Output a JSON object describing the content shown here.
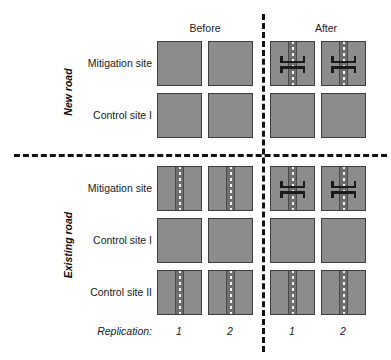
{
  "figure": {
    "type": "experimental-design-diagram",
    "colors": {
      "cell_fill": "#8c8c8c",
      "cell_border": "#3d3d3d",
      "road_fill": "#6e6e6e",
      "road_centerline": "#f2f2f2",
      "crossing_structure": "#1a1a1a",
      "divider": "#121212",
      "background": "#ffffff",
      "text": "#1a1a1a"
    },
    "column_headers": [
      {
        "label": "Before"
      },
      {
        "label": "After"
      }
    ],
    "sections": [
      {
        "name": "New road",
        "rows": [
          {
            "label": "Mitigation site",
            "cells": [
              {
                "period": "Before",
                "replication": "1",
                "road": false,
                "crossings": 0
              },
              {
                "period": "Before",
                "replication": "2",
                "road": false,
                "crossings": 0
              },
              {
                "period": "After",
                "replication": "1",
                "road": true,
                "crossings": 2
              },
              {
                "period": "After",
                "replication": "2",
                "road": true,
                "crossings": 2
              }
            ]
          },
          {
            "label": "Control site I",
            "cells": [
              {
                "period": "Before",
                "replication": "1",
                "road": false,
                "crossings": 0
              },
              {
                "period": "Before",
                "replication": "2",
                "road": false,
                "crossings": 0
              },
              {
                "period": "After",
                "replication": "1",
                "road": false,
                "crossings": 0
              },
              {
                "period": "After",
                "replication": "2",
                "road": false,
                "crossings": 0
              }
            ]
          }
        ]
      },
      {
        "name": "Existing road",
        "rows": [
          {
            "label": "Mitigation site",
            "cells": [
              {
                "period": "Before",
                "replication": "1",
                "road": true,
                "crossings": 0
              },
              {
                "period": "Before",
                "replication": "2",
                "road": true,
                "crossings": 0
              },
              {
                "period": "After",
                "replication": "1",
                "road": true,
                "crossings": 2
              },
              {
                "period": "After",
                "replication": "2",
                "road": true,
                "crossings": 2
              }
            ]
          },
          {
            "label": "Control site I",
            "cells": [
              {
                "period": "Before",
                "replication": "1",
                "road": false,
                "crossings": 0
              },
              {
                "period": "Before",
                "replication": "2",
                "road": false,
                "crossings": 0
              },
              {
                "period": "After",
                "replication": "1",
                "road": false,
                "crossings": 0
              },
              {
                "period": "After",
                "replication": "2",
                "road": false,
                "crossings": 0
              }
            ]
          },
          {
            "label": "Control site II",
            "cells": [
              {
                "period": "Before",
                "replication": "1",
                "road": true,
                "crossings": 0
              },
              {
                "period": "Before",
                "replication": "2",
                "road": true,
                "crossings": 0
              },
              {
                "period": "After",
                "replication": "1",
                "road": true,
                "crossings": 0
              },
              {
                "period": "After",
                "replication": "2",
                "road": true,
                "crossings": 0
              }
            ]
          }
        ]
      }
    ],
    "footer": {
      "replication_label": "Replication:",
      "replication_numbers": [
        "1",
        "2",
        "1",
        "2"
      ]
    }
  }
}
